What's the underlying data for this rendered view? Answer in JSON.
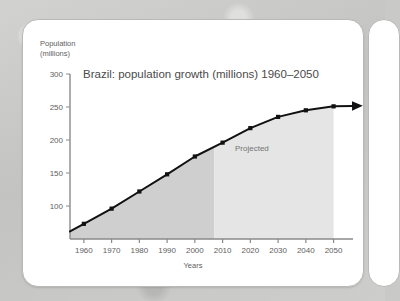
{
  "figure": {
    "y_axis_title_line1": "Population",
    "y_axis_title_line2": "(millions)",
    "x_axis_title": "Years",
    "projected_label": "Projected"
  },
  "colors": {
    "page_background": "#c8c8c6",
    "panel_background": "#ffffff",
    "panel_border": "#b9b9b7",
    "axis": "#8a8a8a",
    "line": "#111111",
    "marker": "#111111",
    "fill_historic": "#cfcfcf",
    "fill_projected": "#e5e5e5",
    "text": "#5e5e5e",
    "title_text": "#4a4a4a"
  },
  "chart_data": {
    "type": "line",
    "title": "Brazil: population growth (millions) 1960–2050",
    "xlabel": "Years",
    "ylabel": "Population (millions)",
    "xlim": [
      1955,
      2057
    ],
    "ylim": [
      50,
      300
    ],
    "grid": false,
    "legend": false,
    "x": [
      1960,
      1970,
      1980,
      1990,
      2000,
      2010,
      2020,
      2030,
      2040,
      2050
    ],
    "values": [
      73,
      96,
      122,
      148,
      175,
      196,
      218,
      235,
      245,
      251
    ],
    "series": [
      {
        "name": "Brazil population (millions)",
        "values": [
          73,
          96,
          122,
          148,
          175,
          196,
          218,
          235,
          245,
          251
        ]
      }
    ],
    "xtick_labels": [
      "1960",
      "1970",
      "1980",
      "1990",
      "2000",
      "2010",
      "2020",
      "2030",
      "2040",
      "2050"
    ],
    "ytick_labels": [
      "100",
      "150",
      "200",
      "250",
      "300"
    ],
    "yticks": [
      100,
      150,
      200,
      250,
      300
    ],
    "annotations": [
      {
        "text": "Projected",
        "x_start": 2007,
        "x_end": 2050,
        "description": "Lighter shaded band covering projected years"
      }
    ],
    "shaded_regions": [
      {
        "name": "historic",
        "x_start": 1955,
        "x_end": 2007,
        "color": "#cfcfcf"
      },
      {
        "name": "projected",
        "x_start": 2007,
        "x_end": 2050,
        "color": "#e5e5e5"
      }
    ],
    "arrow_end": {
      "x": 2057,
      "note": "Line continues with an arrowhead past 2050"
    }
  }
}
